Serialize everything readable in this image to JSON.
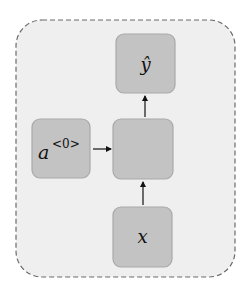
{
  "diagram": {
    "title": "",
    "colors": {
      "background": "#ffffff",
      "container_fill": "#efefef",
      "container_stroke": "#6a6a6a",
      "node_fill": "#c3c3c3",
      "node_stroke": "#a9a9a9",
      "arrow": "#111111"
    },
    "nodes": [
      {
        "id": "y_hat",
        "label": "ŷ",
        "superscript": ""
      },
      {
        "id": "a0",
        "label": "a",
        "superscript": "<0>"
      },
      {
        "id": "cell",
        "label": "",
        "superscript": ""
      },
      {
        "id": "x",
        "label": "x",
        "superscript": ""
      }
    ],
    "edges": [
      {
        "from": "a0",
        "to": "cell"
      },
      {
        "from": "x",
        "to": "cell"
      },
      {
        "from": "cell",
        "to": "y_hat"
      }
    ]
  }
}
